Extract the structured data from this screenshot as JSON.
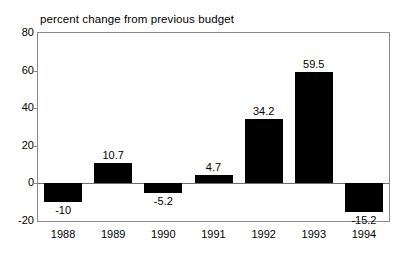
{
  "chart_data": {
    "type": "bar",
    "title": "percent change from previous budget",
    "xlabel": "",
    "ylabel": "",
    "categories": [
      "1988",
      "1989",
      "1990",
      "1991",
      "1992",
      "1993",
      "1994"
    ],
    "values": [
      -10,
      10.7,
      -5.2,
      4.7,
      34.2,
      59.5,
      -15.2
    ],
    "value_labels": [
      "-10",
      "10.7",
      "-5.2",
      "4.7",
      "34.2",
      "59.5",
      "-15.2"
    ],
    "series": [
      {
        "name": "percent change from previous budget",
        "values": [
          -10,
          10.7,
          -5.2,
          4.7,
          34.2,
          59.5,
          -15.2
        ]
      }
    ],
    "ylim": [
      -20,
      80
    ],
    "yticks": [
      80,
      60,
      40,
      20,
      0,
      -20
    ],
    "ytick_labels": [
      "80",
      "60",
      "40",
      "20",
      "0",
      "-20"
    ],
    "grid": false,
    "legend": false,
    "legend_position": "none",
    "bar_color": "#000000",
    "frame_color": "#8a8a8a",
    "background_color": "#ffffff",
    "zero_line_value": 0
  }
}
